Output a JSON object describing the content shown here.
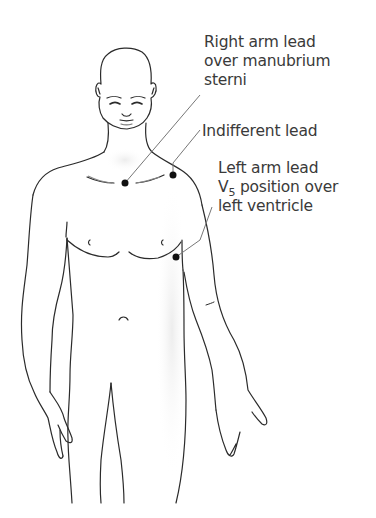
{
  "figure": {
    "type": "anatomical-diagram",
    "line_color": "#2b2b2b",
    "dot_color": "#111111",
    "text_color": "#3a3a3a"
  },
  "labels": [
    {
      "id": "right-arm-lead",
      "lines": [
        "Right arm lead",
        "over manubrium",
        "sterni"
      ]
    },
    {
      "id": "indifferent-lead",
      "lines": [
        "Indifferent lead"
      ]
    },
    {
      "id": "left-arm-lead",
      "lines": [
        "Left arm lead",
        "V",
        "5",
        " position over",
        "left ventricle"
      ]
    }
  ],
  "electrodes": [
    {
      "name": "right-arm-lead",
      "x": 125,
      "y": 183
    },
    {
      "name": "indifferent-lead",
      "x": 173,
      "y": 175
    },
    {
      "name": "left-arm-lead",
      "x": 176,
      "y": 257
    }
  ]
}
